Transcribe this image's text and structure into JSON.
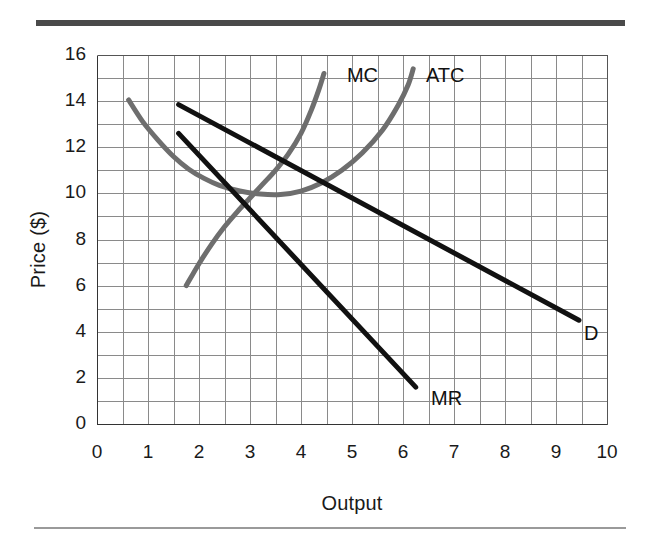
{
  "figure": {
    "type": "economics-graph",
    "top_rule_color": "#4a4a4a",
    "bottom_rule_color": "#9a9a9a"
  },
  "chart_data": {
    "type": "line",
    "title": "",
    "xlabel": "Output",
    "ylabel": "Price ($)",
    "xlim": [
      0,
      10
    ],
    "ylim": [
      0,
      16
    ],
    "xticks": [
      "0",
      "1",
      "2",
      "3",
      "4",
      "5",
      "6",
      "7",
      "8",
      "9",
      "10"
    ],
    "yticks": [
      "0",
      "2",
      "4",
      "6",
      "8",
      "10",
      "12",
      "14",
      "16"
    ],
    "x_minor_step": 0.5,
    "y_minor_step": 1,
    "grid": true,
    "grid_color": "#8a8a8a",
    "legend_position": "inline-labels",
    "series": [
      {
        "name": "MC",
        "label": "MC",
        "color": "#6e6e6e",
        "width": 5,
        "label_xy": [
          4.9,
          15.1
        ],
        "points": [
          [
            1.75,
            6.0
          ],
          [
            2.0,
            6.95
          ],
          [
            2.25,
            7.8
          ],
          [
            2.5,
            8.55
          ],
          [
            2.75,
            9.2
          ],
          [
            3.0,
            9.8
          ],
          [
            3.25,
            10.4
          ],
          [
            3.5,
            11.0
          ],
          [
            3.75,
            11.7
          ],
          [
            4.0,
            12.6
          ],
          [
            4.2,
            13.6
          ],
          [
            4.35,
            14.5
          ],
          [
            4.45,
            15.2
          ]
        ]
      },
      {
        "name": "ATC",
        "label": "ATC",
        "color": "#6e6e6e",
        "width": 5,
        "label_xy": [
          6.45,
          15.1
        ],
        "points": [
          [
            0.62,
            14.05
          ],
          [
            0.9,
            13.1
          ],
          [
            1.2,
            12.3
          ],
          [
            1.5,
            11.6
          ],
          [
            1.8,
            11.05
          ],
          [
            2.1,
            10.65
          ],
          [
            2.4,
            10.35
          ],
          [
            2.8,
            10.1
          ],
          [
            3.2,
            9.97
          ],
          [
            3.6,
            9.95
          ],
          [
            4.0,
            10.1
          ],
          [
            4.4,
            10.45
          ],
          [
            4.8,
            11.0
          ],
          [
            5.2,
            11.75
          ],
          [
            5.6,
            12.75
          ],
          [
            5.9,
            13.8
          ],
          [
            6.1,
            14.7
          ],
          [
            6.2,
            15.4
          ]
        ]
      },
      {
        "name": "D",
        "label": "D",
        "color": "#111111",
        "width": 5,
        "label_xy": [
          9.55,
          3.9
        ],
        "points": [
          [
            1.6,
            13.85
          ],
          [
            9.45,
            4.5
          ]
        ]
      },
      {
        "name": "MR",
        "label": "MR",
        "color": "#111111",
        "width": 5,
        "label_xy": [
          6.55,
          1.1
        ],
        "points": [
          [
            1.6,
            12.6
          ],
          [
            6.25,
            1.6
          ]
        ]
      }
    ]
  }
}
